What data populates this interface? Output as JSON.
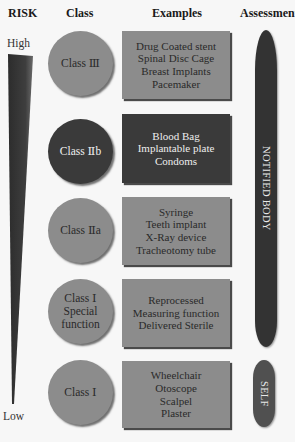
{
  "headers": {
    "risk": "RISK",
    "class": "Class",
    "examples": "Examples",
    "assessment": "Assessment"
  },
  "risk_scale": {
    "high_label": "High",
    "low_label": "Low"
  },
  "rows": [
    {
      "class_label": "Class Ⅲ",
      "examples": [
        "Drug Coated stent",
        "Spinal Disc Cage",
        "Breast Implants",
        "Pacemaker"
      ]
    },
    {
      "class_label": "Class Ⅱb",
      "examples": [
        "Blood Bag",
        "Implantable plate",
        "Condoms"
      ]
    },
    {
      "class_label": "Class Ⅱa",
      "examples": [
        "Syringe",
        "Teeth implant",
        "X-Ray device",
        "Tracheotomy tube"
      ]
    },
    {
      "class_label_lines": [
        "Class Ⅰ",
        "Special",
        "function"
      ],
      "examples": [
        "Reprocessed",
        "Measuring function",
        "Delivered Sterile"
      ]
    },
    {
      "class_label": "Class Ⅰ",
      "examples": [
        "Wheelchair",
        "Otoscope",
        "Scalpel",
        "Plaster"
      ]
    }
  ],
  "assessment": {
    "notified_body": "NOTIFIED BODY",
    "self": "SELF"
  },
  "colors": {
    "light_fill": "#8c8c8c",
    "dark_fill": "#3a3a3a",
    "pill_fill": "#333333",
    "background": "#f7f7f7"
  }
}
